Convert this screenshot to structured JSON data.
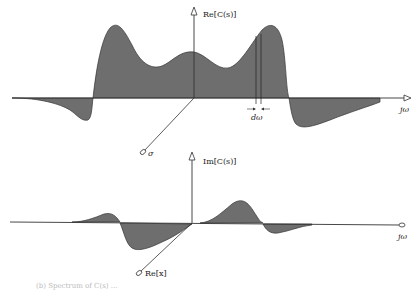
{
  "top_plot": {
    "y_axis_label": "Re[C(s)]",
    "x_axis_label": "jω",
    "depth_axis_label": "σ",
    "increment_label": "dω",
    "fill_color": "#6e6e6e"
  },
  "bottom_plot": {
    "y_axis_label": "Im[C(s)]",
    "x_axis_label": "jω",
    "depth_axis_label": "Re[x]",
    "fill_color": "#6e6e6e"
  },
  "caption": "(b) Spectrum of C(s) ..."
}
